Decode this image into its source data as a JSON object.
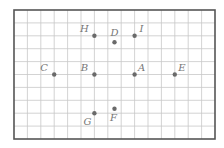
{
  "diagram": {
    "type": "grid-points",
    "grid": {
      "columns": 15,
      "rows": 10,
      "origin_px": [
        14,
        10
      ],
      "cell_w": 13.4,
      "cell_h": 12.9,
      "line_color": "#c8c8c8",
      "border_color": "#555555"
    },
    "point_color": "#6a6a6a",
    "label_color": "#777777",
    "points": [
      {
        "label": "A",
        "col": 9,
        "row": 5,
        "label_pos": "up-right"
      },
      {
        "label": "B",
        "col": 6,
        "row": 5,
        "label_pos": "up-left"
      },
      {
        "label": "C",
        "col": 3,
        "row": 5,
        "label_pos": "up-left"
      },
      {
        "label": "D",
        "col": 7.5,
        "row": 2.5,
        "label_pos": "up"
      },
      {
        "label": "E",
        "col": 12,
        "row": 5,
        "label_pos": "up-right"
      },
      {
        "label": "F",
        "col": 7.5,
        "row": 7.65,
        "label_pos": "down"
      },
      {
        "label": "G",
        "col": 6,
        "row": 8,
        "label_pos": "down-left"
      },
      {
        "label": "H",
        "col": 6,
        "row": 2,
        "label_pos": "up-left"
      },
      {
        "label": "I",
        "col": 9,
        "row": 2,
        "label_pos": "up-right"
      }
    ]
  }
}
